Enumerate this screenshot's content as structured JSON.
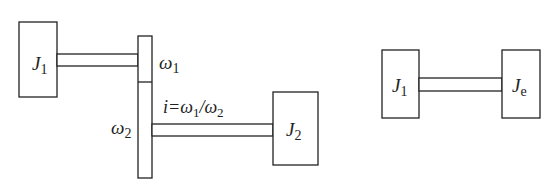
{
  "left_diagram": {
    "inertia_1": {
      "symbol": "J",
      "subscript": "1"
    },
    "inertia_2": {
      "symbol": "J",
      "subscript": "2"
    },
    "gear_1_speed": {
      "symbol": "ω",
      "subscript": "1"
    },
    "gear_2_speed": {
      "symbol": "ω",
      "subscript": "2"
    },
    "ratio": {
      "prefix": "i=",
      "num": "ω",
      "num_sub": "1",
      "slash": "/",
      "den": "ω",
      "den_sub": "2"
    }
  },
  "right_diagram": {
    "inertia_1": {
      "symbol": "J",
      "subscript": "1"
    },
    "inertia_eq": {
      "symbol": "J",
      "subscript": "e"
    }
  }
}
